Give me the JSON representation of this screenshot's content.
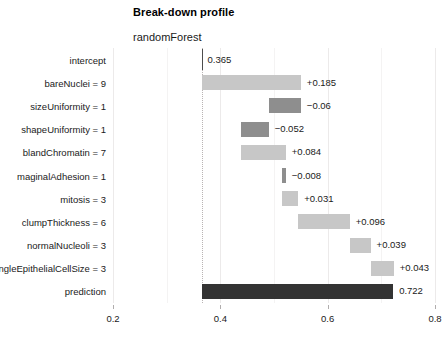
{
  "chart_data": {
    "type": "bar",
    "title": "Break-down profile",
    "subtitle": "randomForest",
    "xlabel": "",
    "ylabel": "",
    "xlim": [
      0.2,
      0.8
    ],
    "xticks": [
      "0.2",
      "0.4",
      "0.6",
      "0.8"
    ],
    "xtick_values": [
      0.2,
      0.4,
      0.6,
      0.8
    ],
    "grid": true,
    "legend": "none",
    "intercept": 0.365,
    "prediction": 0.722,
    "categories": [
      "intercept",
      "bareNuclei = 9",
      "sizeUniformity = 1",
      "shapeUniformity = 1",
      "blandChromatin = 7",
      "maginalAdhesion = 1",
      "mitosis = 3",
      "clumpThickness = 6",
      "normalNucleoli = 3",
      "singleEpithelialCellSize = 3",
      "prediction"
    ],
    "contributions": [
      0.365,
      0.185,
      -0.06,
      -0.052,
      0.084,
      -0.008,
      0.031,
      0.096,
      0.039,
      0.043,
      0.722
    ],
    "cumulative_start": [
      0.365,
      0.365,
      0.55,
      0.49,
      0.438,
      0.522,
      0.514,
      0.545,
      0.641,
      0.68,
      0.365
    ],
    "cumulative_end": [
      0.365,
      0.55,
      0.49,
      0.438,
      0.522,
      0.514,
      0.545,
      0.641,
      0.68,
      0.723,
      0.722
    ],
    "value_labels": [
      "0.365",
      "+0.185",
      "−0.06",
      "−0.052",
      "+0.084",
      "−0.008",
      "+0.031",
      "+0.096",
      "+0.039",
      "+0.043",
      "0.722"
    ],
    "bar_kinds": [
      "none",
      "pos",
      "neg",
      "neg",
      "pos",
      "neg",
      "pos",
      "pos",
      "pos",
      "pos",
      "total"
    ],
    "colors": {
      "positive": "#c7c7c7",
      "negative": "#8e8e8e",
      "total": "#333333",
      "gridline": "#eceaea",
      "reference_line": "#b9b4b4",
      "text": "#1a1a1a",
      "background": "#ffffff"
    }
  }
}
